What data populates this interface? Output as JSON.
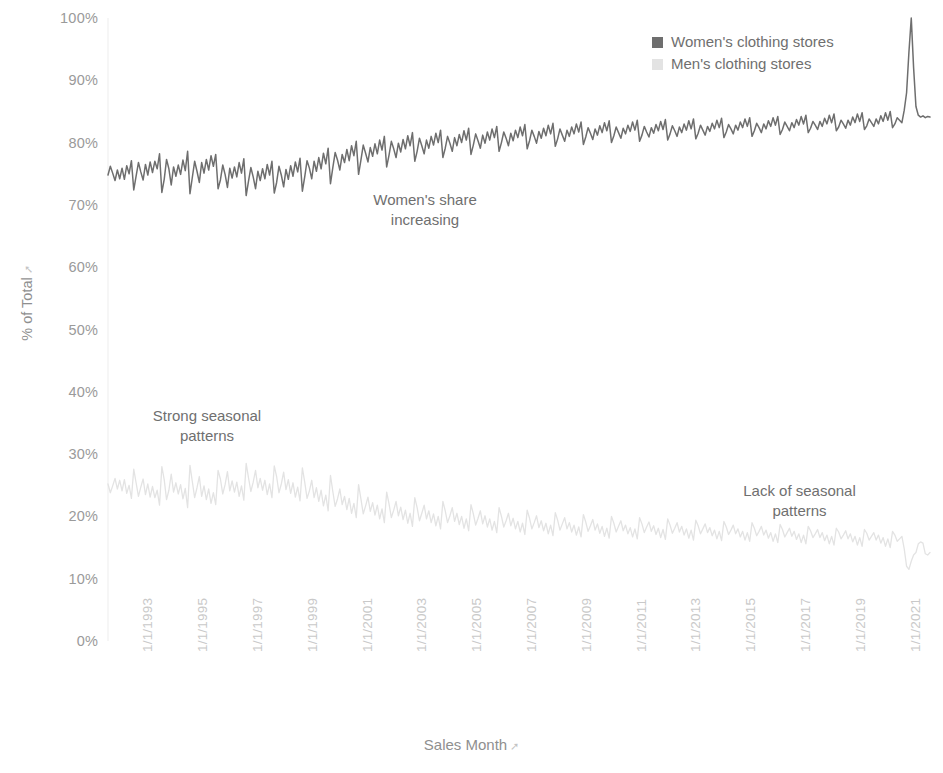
{
  "legend": {
    "position": "top-right",
    "items": [
      {
        "label": "Women's clothing stores",
        "color": "#6e6e6e",
        "icon": "square-swatch"
      },
      {
        "label": "Men's clothing stores",
        "color": "#e3e3e3",
        "icon": "square-swatch"
      }
    ]
  },
  "axes": {
    "y_title": "% of Total",
    "y_sort_icon": "sort-ascending-icon",
    "x_title": "Sales Month",
    "x_sort_icon": "sort-ascending-icon"
  },
  "annotations": [
    {
      "id": "womens-share",
      "text": "Women's share\nincreasing"
    },
    {
      "id": "strong-seasonal",
      "text": "Strong seasonal\npatterns"
    },
    {
      "id": "lack-seasonal",
      "text": "Lack of seasonal\npatterns"
    }
  ],
  "chart_data": {
    "type": "line",
    "title": "",
    "subtitle": "",
    "xlabel": "Sales Month",
    "ylabel": "% of Total",
    "ylim": [
      0,
      100
    ],
    "ytick_labels": [
      "100%",
      "90%",
      "80%",
      "70%",
      "60%",
      "50%",
      "40%",
      "30%",
      "20%",
      "10%",
      "0%"
    ],
    "ytick_values": [
      100,
      90,
      80,
      70,
      60,
      50,
      40,
      30,
      20,
      10,
      0
    ],
    "xtick_labels": [
      "1/1/1993",
      "1/1/1995",
      "1/1/1997",
      "1/1/1999",
      "1/1/2001",
      "1/1/2003",
      "1/1/2005",
      "1/1/2007",
      "1/1/2009",
      "1/1/2011",
      "1/1/2013",
      "1/1/2015",
      "1/1/2017",
      "1/1/2019",
      "1/1/2021"
    ],
    "xlim": [
      "1/1/1992",
      "12/1/2021"
    ],
    "grid": false,
    "legend_position": "top-right",
    "x_start_year": 1992,
    "x_end_year": 2022,
    "series": [
      {
        "name": "Women's clothing stores",
        "color": "#6e6e6e",
        "values": [
          74.8,
          76.2,
          75.1,
          73.9,
          75.6,
          74.2,
          75.9,
          74.1,
          76.3,
          75.0,
          77.1,
          72.4,
          74.6,
          76.8,
          75.3,
          74.0,
          76.5,
          74.8,
          76.9,
          75.2,
          77.0,
          75.8,
          78.2,
          72.0,
          74.1,
          77.3,
          75.8,
          73.2,
          76.1,
          74.6,
          76.4,
          74.9,
          77.2,
          75.5,
          78.6,
          71.8,
          74.4,
          77.0,
          75.4,
          73.6,
          76.8,
          75.1,
          77.3,
          75.6,
          77.9,
          76.2,
          78.1,
          72.6,
          74.0,
          76.4,
          74.9,
          72.8,
          75.9,
          74.3,
          76.1,
          74.5,
          76.8,
          75.1,
          77.4,
          71.5,
          73.8,
          76.0,
          74.5,
          72.6,
          75.4,
          73.9,
          75.8,
          74.2,
          76.5,
          74.8,
          77.0,
          71.9,
          73.6,
          76.2,
          74.8,
          72.9,
          75.7,
          74.1,
          76.3,
          74.6,
          76.9,
          75.3,
          77.5,
          72.2,
          74.5,
          77.1,
          75.9,
          74.2,
          77.0,
          75.4,
          77.6,
          75.8,
          78.3,
          76.6,
          79.1,
          73.4,
          76.0,
          78.4,
          77.2,
          75.6,
          78.1,
          76.8,
          78.9,
          77.1,
          79.5,
          77.9,
          80.2,
          74.9,
          77.2,
          79.6,
          78.3,
          76.9,
          79.2,
          77.8,
          79.8,
          78.2,
          80.4,
          78.8,
          81.0,
          76.1,
          78.0,
          80.2,
          79.0,
          77.6,
          79.9,
          78.5,
          80.5,
          79.0,
          81.1,
          79.5,
          81.6,
          77.0,
          78.6,
          80.7,
          79.5,
          78.2,
          80.4,
          79.1,
          81.0,
          79.6,
          81.5,
          80.0,
          82.0,
          77.6,
          79.1,
          81.0,
          79.9,
          78.6,
          80.8,
          79.5,
          81.3,
          80.0,
          81.9,
          80.4,
          82.3,
          78.1,
          79.6,
          81.4,
          80.3,
          79.1,
          81.2,
          79.9,
          81.7,
          80.4,
          82.2,
          80.8,
          82.6,
          78.6,
          80.0,
          81.7,
          80.7,
          79.5,
          81.5,
          80.3,
          82.0,
          80.8,
          82.5,
          81.1,
          82.9,
          79.0,
          80.3,
          82.0,
          81.0,
          79.9,
          81.8,
          80.7,
          82.3,
          81.1,
          82.8,
          81.4,
          83.1,
          79.4,
          80.6,
          82.2,
          81.2,
          80.2,
          82.0,
          81.0,
          82.5,
          81.4,
          83.0,
          81.7,
          83.3,
          79.7,
          80.9,
          82.4,
          81.5,
          80.5,
          82.2,
          81.2,
          82.7,
          81.6,
          83.2,
          81.9,
          83.5,
          80.0,
          81.1,
          82.5,
          81.6,
          80.7,
          82.3,
          81.4,
          82.8,
          81.8,
          83.3,
          82.0,
          83.6,
          80.2,
          81.2,
          82.6,
          81.7,
          80.9,
          82.4,
          81.5,
          82.9,
          81.9,
          83.4,
          82.1,
          83.7,
          80.4,
          81.4,
          82.7,
          81.9,
          81.0,
          82.5,
          81.6,
          83.0,
          82.0,
          83.5,
          82.2,
          83.8,
          80.6,
          81.5,
          82.8,
          82.0,
          81.2,
          82.6,
          81.8,
          83.1,
          82.2,
          83.6,
          82.4,
          83.9,
          80.8,
          81.7,
          82.9,
          82.2,
          81.4,
          82.8,
          82.0,
          83.3,
          82.4,
          83.8,
          82.6,
          84.0,
          81.0,
          81.9,
          83.1,
          82.4,
          81.6,
          83.0,
          82.2,
          83.5,
          82.6,
          84.0,
          82.8,
          84.2,
          81.3,
          82.1,
          83.3,
          82.6,
          81.9,
          83.2,
          82.4,
          83.7,
          82.8,
          84.2,
          83.0,
          84.4,
          81.6,
          82.3,
          83.4,
          82.8,
          82.1,
          83.4,
          82.6,
          83.9,
          83.0,
          84.4,
          83.2,
          84.6,
          81.9,
          82.5,
          83.6,
          83.0,
          82.3,
          83.6,
          82.8,
          84.1,
          83.2,
          84.6,
          83.4,
          84.8,
          82.1,
          82.7,
          83.8,
          83.2,
          82.6,
          83.8,
          83.0,
          84.3,
          83.4,
          84.8,
          83.6,
          85.0,
          82.4,
          83.0,
          84.0,
          83.6,
          83.2,
          85.2,
          88.0,
          94.5,
          100.0,
          92.0,
          85.8,
          84.4,
          84.1,
          84.3,
          84.0,
          84.2,
          84.1
        ]
      },
      {
        "name": "Men's clothing stores",
        "color": "#e3e3e3",
        "values": [
          25.2,
          23.8,
          24.9,
          26.1,
          24.4,
          25.8,
          24.1,
          25.9,
          23.7,
          25.0,
          22.9,
          27.6,
          25.4,
          23.2,
          24.7,
          26.0,
          23.5,
          25.2,
          23.1,
          24.8,
          23.0,
          24.2,
          21.8,
          28.0,
          25.9,
          22.7,
          24.2,
          26.8,
          23.9,
          25.4,
          23.6,
          25.1,
          22.8,
          24.5,
          21.4,
          28.2,
          25.6,
          23.0,
          24.6,
          26.4,
          23.2,
          24.9,
          22.7,
          24.4,
          22.1,
          23.8,
          21.9,
          27.4,
          26.0,
          23.6,
          25.1,
          27.2,
          24.1,
          25.7,
          23.9,
          25.5,
          23.2,
          24.9,
          22.6,
          28.5,
          26.2,
          24.0,
          25.5,
          27.4,
          24.6,
          26.1,
          24.2,
          25.8,
          23.5,
          25.2,
          23.0,
          28.1,
          26.4,
          23.8,
          25.2,
          27.1,
          24.3,
          25.9,
          23.7,
          25.4,
          23.1,
          24.7,
          22.5,
          27.8,
          25.5,
          22.9,
          24.1,
          25.8,
          23.0,
          24.6,
          22.4,
          24.2,
          21.7,
          23.4,
          20.9,
          26.6,
          24.0,
          21.6,
          22.8,
          24.4,
          21.9,
          23.2,
          21.1,
          22.9,
          20.5,
          22.1,
          19.8,
          25.1,
          22.8,
          20.4,
          21.7,
          23.1,
          20.8,
          22.2,
          20.2,
          21.8,
          19.6,
          21.2,
          19.0,
          23.9,
          22.0,
          19.8,
          21.0,
          22.4,
          20.1,
          21.5,
          19.5,
          21.0,
          18.9,
          20.5,
          18.4,
          23.0,
          21.4,
          19.3,
          20.5,
          21.8,
          19.6,
          20.9,
          19.0,
          20.4,
          18.5,
          20.0,
          18.0,
          22.4,
          20.9,
          19.0,
          20.1,
          21.4,
          19.2,
          20.5,
          18.7,
          20.0,
          18.1,
          19.6,
          17.7,
          21.9,
          20.4,
          18.6,
          19.7,
          20.9,
          18.8,
          20.1,
          18.3,
          19.6,
          17.8,
          19.2,
          17.4,
          21.4,
          20.0,
          18.3,
          19.3,
          20.5,
          18.5,
          19.7,
          18.0,
          19.2,
          17.5,
          18.9,
          17.1,
          21.0,
          19.7,
          18.0,
          19.0,
          20.1,
          18.2,
          19.3,
          17.7,
          18.9,
          17.2,
          18.6,
          16.9,
          20.6,
          19.4,
          17.8,
          18.8,
          19.8,
          18.0,
          19.0,
          17.5,
          18.6,
          17.0,
          18.3,
          16.7,
          20.3,
          19.1,
          17.6,
          18.5,
          19.5,
          17.8,
          18.8,
          17.3,
          18.4,
          16.8,
          18.1,
          16.5,
          20.0,
          18.9,
          17.5,
          18.4,
          19.3,
          17.7,
          18.6,
          17.2,
          18.2,
          16.7,
          18.0,
          16.4,
          19.8,
          18.8,
          17.4,
          18.3,
          19.1,
          17.6,
          18.5,
          17.1,
          18.1,
          16.6,
          17.9,
          16.3,
          19.6,
          18.6,
          17.3,
          18.1,
          19.0,
          17.5,
          18.4,
          17.0,
          18.0,
          16.5,
          17.8,
          16.2,
          19.4,
          18.5,
          17.2,
          18.0,
          18.8,
          17.4,
          18.2,
          16.9,
          17.8,
          16.4,
          17.6,
          16.1,
          19.2,
          18.3,
          17.1,
          17.8,
          18.6,
          17.2,
          18.0,
          16.7,
          17.6,
          16.2,
          17.4,
          16.0,
          19.0,
          18.1,
          16.9,
          17.6,
          18.4,
          17.0,
          17.8,
          16.5,
          17.4,
          16.0,
          17.2,
          15.8,
          18.7,
          17.9,
          16.7,
          17.4,
          18.1,
          16.8,
          17.6,
          16.3,
          17.2,
          15.8,
          17.0,
          15.6,
          18.4,
          17.7,
          16.6,
          17.2,
          17.9,
          16.6,
          17.4,
          16.1,
          17.0,
          15.6,
          16.8,
          15.4,
          18.1,
          17.5,
          16.4,
          17.0,
          17.7,
          16.4,
          17.2,
          15.9,
          16.8,
          15.4,
          16.6,
          15.2,
          17.9,
          17.3,
          16.2,
          16.8,
          17.4,
          16.2,
          17.0,
          15.7,
          16.6,
          15.2,
          16.4,
          15.0,
          17.6,
          17.0,
          16.0,
          16.4,
          16.8,
          14.8,
          12.0,
          11.5,
          12.8,
          13.8,
          14.2,
          15.6,
          15.9,
          15.7,
          14.0,
          13.8,
          14.2
        ]
      }
    ]
  }
}
